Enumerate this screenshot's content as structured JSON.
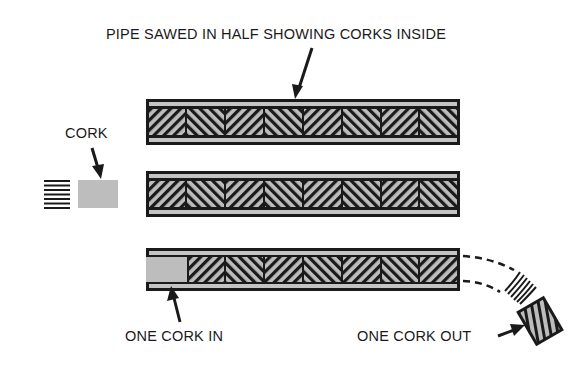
{
  "labels": {
    "pipe_title": "PIPE SAWED IN HALF SHOWING CORKS INSIDE",
    "cork": "CORK",
    "one_cork_in": "ONE CORK IN",
    "one_cork_out": "ONE CORK OUT"
  },
  "pipes": [
    {
      "id": "pipe-1",
      "y": 99,
      "corks": 8,
      "state": "full"
    },
    {
      "id": "pipe-2",
      "y": 171,
      "corks": 8,
      "state": "full"
    },
    {
      "id": "pipe-3",
      "y": 248,
      "corks": 8,
      "state": "one-in-one-out"
    }
  ],
  "colors": {
    "ink": "#1a1a1a",
    "cork_fill": "#bdbdbd",
    "wall_fill": "#c4c4c4",
    "background": "#ffffff"
  }
}
